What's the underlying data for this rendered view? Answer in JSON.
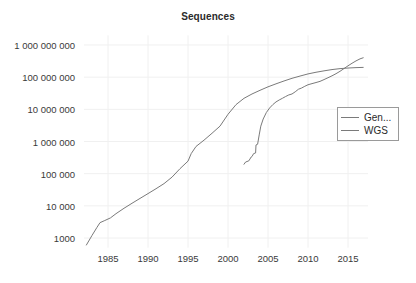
{
  "chart_data": {
    "type": "line",
    "title": "Sequences",
    "xlabel": "",
    "ylabel": "",
    "yscale": "log",
    "xlim": [
      1982,
      2017.5
    ],
    "ylim": [
      500,
      2000000000
    ],
    "grid": true,
    "legend_position": "right",
    "xticks": [
      1985,
      1990,
      1995,
      2000,
      2005,
      2010,
      2015
    ],
    "xtick_labels": [
      "1985",
      "1990",
      "1995",
      "2000",
      "2005",
      "2010",
      "2015"
    ],
    "yticks": [
      1000,
      10000,
      100000,
      1000000,
      10000000,
      100000000,
      1000000000
    ],
    "ytick_labels": [
      "1000",
      "10 000",
      "100 000",
      "1 000 000",
      "10 000 000",
      "100 000 000",
      "1 000 000 000"
    ],
    "series": [
      {
        "name": "Gen...",
        "color": "#7a7a7a",
        "x": [
          1982.3,
          1983.0,
          1983.6,
          1984.0,
          1984.6,
          1985.3,
          1986.0,
          1987.0,
          1988.0,
          1989.0,
          1990.0,
          1991.0,
          1992.0,
          1993.0,
          1994.0,
          1995.0,
          1995.4,
          1996.0,
          1997.0,
          1998.0,
          1999.0,
          2000.0,
          2001.0,
          2002.0,
          2003.0,
          2004.0,
          2005.0,
          2006.0,
          2007.0,
          2008.0,
          2009.0,
          2010.0,
          2011.0,
          2012.0,
          2013.0,
          2014.0,
          2015.0,
          2016.0,
          2016.9
        ],
        "y": [
          606,
          1200,
          2100,
          3000,
          3500,
          4200,
          5700,
          8400,
          12000,
          17000,
          24000,
          34000,
          49000,
          78000,
          143000,
          245000,
          420000,
          700000,
          1100000,
          1800000,
          3000000,
          7000000,
          14000000,
          22000000,
          30000000,
          39000000,
          50000000,
          62000000,
          76000000,
          92000000,
          108000000,
          126000000,
          142000000,
          157000000,
          172000000,
          184000000,
          192000000,
          198000000,
          201000000
        ]
      },
      {
        "name": "WGS",
        "color": "#7a7a7a",
        "x": [
          2002.0,
          2002.2,
          2002.6,
          2002.9,
          2003.0,
          2003.2,
          2003.45,
          2003.5,
          2003.7,
          2003.9,
          2004.1,
          2004.4,
          2004.8,
          2005.2,
          2005.6,
          2006.0,
          2006.4,
          2006.8,
          2007.2,
          2007.6,
          2008.0,
          2008.4,
          2008.8,
          2009.2,
          2009.6,
          2010.0,
          2010.5,
          2011.0,
          2011.5,
          2012.0,
          2012.5,
          2013.0,
          2013.5,
          2014.0,
          2014.5,
          2015.0,
          2015.5,
          2016.0,
          2016.5,
          2016.9
        ],
        "y": [
          196000,
          230000,
          250000,
          330000,
          340000,
          420000,
          440000,
          780000,
          820000,
          1600000,
          3000000,
          5000000,
          8000000,
          11000000,
          14000000,
          17000000,
          19500000,
          22000000,
          25000000,
          28000000,
          30000000,
          35000000,
          42000000,
          46000000,
          52000000,
          58000000,
          63000000,
          68000000,
          74000000,
          84000000,
          96000000,
          110000000,
          128000000,
          152000000,
          185000000,
          225000000,
          270000000,
          320000000,
          370000000,
          400000000
        ]
      }
    ]
  },
  "legend": {
    "items": [
      {
        "label": "Gen..."
      },
      {
        "label": "WGS"
      }
    ]
  }
}
